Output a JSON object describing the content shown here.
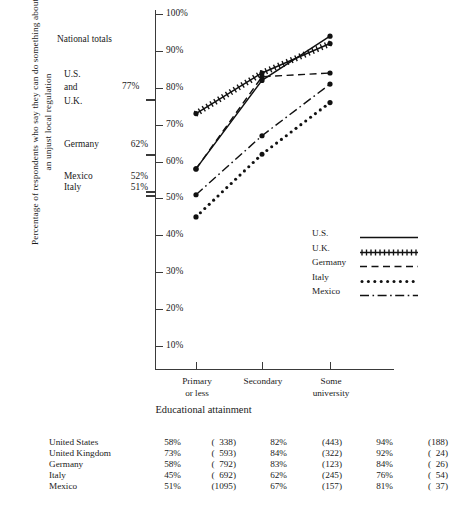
{
  "chart_data": {
    "type": "line",
    "title": "",
    "xlabel": "Educational attainment",
    "ylabel_line1": "Percentage of respondents who say they can do something about",
    "ylabel_line2": "an unjust local regulation",
    "categories": [
      "Primary or less",
      "Secondary",
      "Some university"
    ],
    "ylim": [
      10,
      100
    ],
    "yticks": [
      "10%",
      "20%",
      "30%",
      "40%",
      "50%",
      "60%",
      "70%",
      "80%",
      "90%",
      "100%"
    ],
    "grid": false,
    "legend_position": "right-middle",
    "series": [
      {
        "name": "U.S.",
        "style": "solid",
        "values": [
          58,
          82,
          94
        ]
      },
      {
        "name": "U.K.",
        "style": "cross-hatch",
        "values": [
          73,
          84,
          92
        ]
      },
      {
        "name": "Germany",
        "style": "dashed",
        "values": [
          58,
          83,
          84
        ]
      },
      {
        "name": "Italy",
        "style": "dotted",
        "values": [
          45,
          62,
          76
        ]
      },
      {
        "name": "Mexico",
        "style": "dash-dot",
        "values": [
          51,
          67,
          81
        ]
      }
    ]
  },
  "national_totals": {
    "title": "National totals",
    "us_uk_lines": [
      "U.S.",
      "and",
      "U.K."
    ],
    "us_uk_value": "77%",
    "rows": [
      {
        "name": "Germany",
        "value": "62%"
      },
      {
        "name": "Mexico",
        "value": "52%"
      },
      {
        "name": "Italy",
        "value": "51%"
      }
    ]
  },
  "xaxis": {
    "ticks": [
      {
        "line1": "Primary",
        "line2": "or less"
      },
      {
        "line1": "Secondary",
        "line2": ""
      },
      {
        "line1": "Some",
        "line2": "university"
      }
    ],
    "title": "Educational attainment"
  },
  "legend": {
    "items": [
      {
        "label": "U.S.",
        "style": "solid"
      },
      {
        "label": "U.K.",
        "style": "cross-hatch"
      },
      {
        "label": "Germany",
        "style": "dashed"
      },
      {
        "label": "Italy",
        "style": "dotted"
      },
      {
        "label": "Mexico",
        "style": "dash-dot"
      }
    ]
  },
  "table": {
    "rows": [
      {
        "country": "United States",
        "c1p": "58%",
        "c1n": "(  338)",
        "c2p": "82%",
        "c2n": "(443)",
        "c3p": "94%",
        "c3n": "(188)"
      },
      {
        "country": "United Kingdom",
        "c1p": "73%",
        "c1n": "(  593)",
        "c2p": "84%",
        "c2n": "(322)",
        "c3p": "92%",
        "c3n": "(  24)"
      },
      {
        "country": "Germany",
        "c1p": "58%",
        "c1n": "(  792)",
        "c2p": "83%",
        "c2n": "(123)",
        "c3p": "84%",
        "c3n": "(  26)"
      },
      {
        "country": "Italy",
        "c1p": "45%",
        "c1n": "(  692)",
        "c2p": "62%",
        "c2n": "(245)",
        "c3p": "76%",
        "c3n": "(  54)"
      },
      {
        "country": "Mexico",
        "c1p": "51%",
        "c1n": "(1095)",
        "c2p": "67%",
        "c2n": "(157)",
        "c3p": "81%",
        "c3n": "(  37)"
      }
    ]
  }
}
